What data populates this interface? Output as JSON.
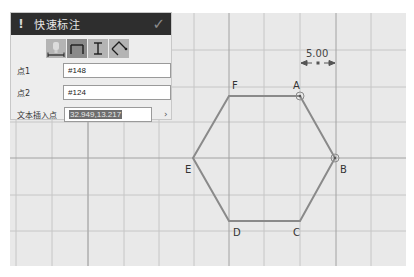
{
  "panel": {
    "title": "快速标注",
    "warning_icon": "!",
    "confirm_icon": "✓",
    "tools": [
      {
        "name": "dimension-type-1",
        "active": false
      },
      {
        "name": "horizontal-dimension",
        "active": true
      },
      {
        "name": "vertical-dimension",
        "active": false
      },
      {
        "name": "angle-dimension",
        "active": false
      }
    ],
    "fields": [
      {
        "label": "点1",
        "value": "#148"
      },
      {
        "label": "点2",
        "value": "#124"
      },
      {
        "label": "文本插入点",
        "value": "32.949,13.217"
      }
    ],
    "expand_icon": "›"
  },
  "drawing": {
    "dimension_value": "5.00",
    "vertices": [
      {
        "label": "A",
        "x": 300,
        "y": 96
      },
      {
        "label": "B",
        "x": 335,
        "y": 158
      },
      {
        "label": "C",
        "x": 300,
        "y": 221
      },
      {
        "label": "D",
        "x": 229,
        "y": 221
      },
      {
        "label": "E",
        "x": 193,
        "y": 158
      },
      {
        "label": "F",
        "x": 229,
        "y": 96
      }
    ],
    "selected_points": [
      "A",
      "B"
    ],
    "colors": {
      "background": "#e9e9e9",
      "grid": "#c4c4c4",
      "axis": "#9a9a9a",
      "shape": "#8a8a8a"
    }
  }
}
